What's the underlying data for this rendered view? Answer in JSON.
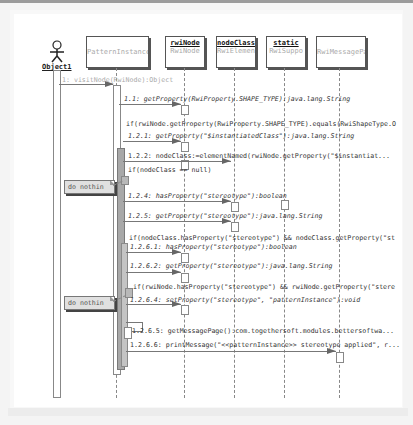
{
  "diagram": {
    "type": "UML sequence diagram",
    "actor": {
      "name": "Object1"
    },
    "objects": [
      {
        "id": "patternInstance",
        "instance": "",
        "class": "PatternInstance"
      },
      {
        "id": "rwiNode",
        "instance": "rwiNode",
        "class": "RwiNode"
      },
      {
        "id": "nodeClass",
        "instance": "nodeClass",
        "class": "RwiElemen"
      },
      {
        "id": "static",
        "instance": "static",
        "class": "RwiSuppo"
      },
      {
        "id": "messagePage",
        "instance": "",
        "class": "RwiMessagePa"
      }
    ],
    "messages": [
      {
        "label": "1: visitNode(RwiNode):Object"
      },
      {
        "label": "1.1: getProperty(RwiProperty.SHAPE_TYPE):java.lang.String"
      },
      {
        "label": "if(rwiNode.getProperty(RwiProperty.SHAPE_TYPE).equals(RwiShapeType.O"
      },
      {
        "label": "1.2.1: getProperty(\"$instantiatedClass\"):java.lang.String"
      },
      {
        "label": "1.2.2: nodeClass:=elementNamed(rwiNode.getProperty(\"$instantiat..."
      },
      {
        "label": "if(nodeClass == null)"
      },
      {
        "label": "1.2.4: hasProperty(\"stereotype\"):boolean"
      },
      {
        "label": "1.2.5: getProperty(\"stereotype\"):java.lang.String"
      },
      {
        "label": "if(nodeClass.hasProperty(\"stereotype\") && nodeClass.getProperty(\"st"
      },
      {
        "label": "1.2.6.1: hasProperty(\"stereotype\"):boolean"
      },
      {
        "label": "1.2.6.2: getProperty(\"stereotype\"):java.lang.String"
      },
      {
        "label": "if(rwiNode.hasProperty(\"stereotype\") && rwiNode.getProperty(\"stere"
      },
      {
        "label": "1.2.6.4: setProperty(\"stereotype\", \"patternInstance\"):void"
      },
      {
        "label": "1.2.6.5: getMessagePage():com.togethersoft.modules.bettersoftwa..."
      },
      {
        "label": "1.2.6.6: printMessage(\"<<patternInstance>> stereotype applied\", r..."
      }
    ],
    "notes": [
      {
        "text": "do nothin"
      },
      {
        "text": "do nothin"
      }
    ]
  }
}
